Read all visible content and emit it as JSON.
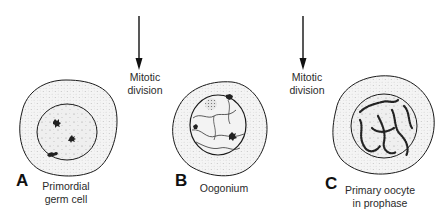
{
  "diagram": {
    "stages": [
      {
        "letter": "A",
        "name_line1": "Primordial",
        "name_line2": "germ cell"
      },
      {
        "letter": "B",
        "name_line1": "Oogonium",
        "name_line2": ""
      },
      {
        "letter": "C",
        "name_line1": "Primary oocyte",
        "name_line2": "in prophase"
      }
    ],
    "transitions": [
      {
        "line1": "Mitotic",
        "line2": "division"
      },
      {
        "line1": "Mitotic",
        "line2": "division"
      }
    ],
    "colors": {
      "outline": "#1a1a1a",
      "cytoplasm": "#f2f2f2",
      "nucleus": "#ececec",
      "stipple": "#9a9a9a",
      "chromatin": "#222222",
      "text": "#2a2a2a"
    }
  }
}
